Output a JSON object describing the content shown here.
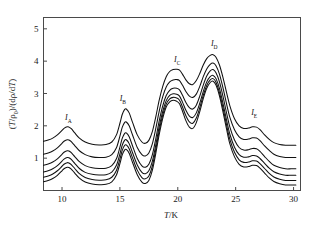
{
  "chart_data": {
    "type": "line",
    "title": "",
    "xlabel": "T/K",
    "ylabel": "(T/ρ0)/(dρ/dT)",
    "xlabel_parts": {
      "italic": "T",
      "rest": "/K"
    },
    "ylabel_parts": {
      "p1_italic": "T",
      "p2": "/ρ",
      "p2_sub": "0",
      "p3": ")/(dρ/d",
      "p4_italic": "T",
      "p5": ")",
      "open": "("
    },
    "xlim": [
      8.4,
      30.6
    ],
    "ylim": [
      0.0,
      5.35
    ],
    "xticks": [
      10,
      15,
      20,
      25,
      30
    ],
    "xticklabels": [
      "10",
      "15",
      "20",
      "25",
      "30"
    ],
    "yticks": [
      1,
      2,
      3,
      4,
      5
    ],
    "yticklabels": [
      "1",
      "2",
      "3",
      "4",
      "5"
    ],
    "grid": false,
    "legend": false,
    "frame": "box",
    "annotations": [
      {
        "name": "I_A",
        "letter": "I",
        "sub": "A",
        "x": 10.55,
        "y": 2.17
      },
      {
        "name": "I_B",
        "letter": "I",
        "sub": "B",
        "x": 15.25,
        "y": 2.78
      },
      {
        "name": "I_C",
        "letter": "I",
        "sub": "C",
        "x": 19.95,
        "y": 3.98
      },
      {
        "name": "I_D",
        "letter": "I",
        "sub": "D",
        "x": 23.15,
        "y": 4.46
      },
      {
        "name": "I_E",
        "letter": "I",
        "sub": "E",
        "x": 26.6,
        "y": 2.32
      }
    ],
    "series_note": "six resistivity-derivative curves, vertically offset",
    "x": [
      8.4,
      8.8,
      9.2,
      9.6,
      10.0,
      10.2,
      10.45,
      10.6,
      10.8,
      11.1,
      11.5,
      12.0,
      12.6,
      13.2,
      13.8,
      14.3,
      14.7,
      15.0,
      15.2,
      15.4,
      15.55,
      15.8,
      16.1,
      16.5,
      16.9,
      17.2,
      17.5,
      17.8,
      18.1,
      18.4,
      18.7,
      19.0,
      19.3,
      19.6,
      19.9,
      20.15,
      20.4,
      20.7,
      21.0,
      21.3,
      21.6,
      21.9,
      22.2,
      22.5,
      22.8,
      23.05,
      23.3,
      23.6,
      23.9,
      24.2,
      24.5,
      24.9,
      25.3,
      25.7,
      26.1,
      26.45,
      26.8,
      27.1,
      27.5,
      27.9,
      28.3,
      28.8,
      29.3,
      29.8,
      30.2
    ],
    "series": [
      {
        "name": "curve-1",
        "baseline": 1.4,
        "values": [
          1.52,
          1.56,
          1.62,
          1.72,
          1.86,
          1.93,
          1.97,
          1.96,
          1.91,
          1.78,
          1.62,
          1.5,
          1.43,
          1.41,
          1.42,
          1.5,
          1.72,
          2.08,
          2.35,
          2.5,
          2.52,
          2.4,
          2.1,
          1.72,
          1.5,
          1.46,
          1.55,
          1.82,
          2.28,
          2.8,
          3.22,
          3.52,
          3.68,
          3.74,
          3.75,
          3.72,
          3.6,
          3.42,
          3.3,
          3.28,
          3.4,
          3.62,
          3.88,
          4.08,
          4.18,
          4.2,
          4.12,
          3.88,
          3.5,
          3.05,
          2.62,
          2.22,
          2.0,
          1.92,
          1.93,
          1.97,
          1.96,
          1.88,
          1.72,
          1.58,
          1.48,
          1.42,
          1.4,
          1.4,
          1.4
        ]
      },
      {
        "name": "curve-2",
        "baseline": 1.02,
        "values": [
          1.12,
          1.16,
          1.22,
          1.32,
          1.46,
          1.53,
          1.57,
          1.56,
          1.51,
          1.39,
          1.23,
          1.11,
          1.04,
          1.02,
          1.03,
          1.11,
          1.32,
          1.68,
          1.95,
          2.1,
          2.12,
          2.0,
          1.71,
          1.33,
          1.11,
          1.07,
          1.16,
          1.44,
          1.92,
          2.46,
          2.9,
          3.2,
          3.36,
          3.42,
          3.43,
          3.4,
          3.26,
          3.06,
          2.92,
          2.88,
          2.98,
          3.22,
          3.52,
          3.76,
          3.9,
          3.94,
          3.86,
          3.6,
          3.18,
          2.7,
          2.26,
          1.88,
          1.66,
          1.58,
          1.59,
          1.63,
          1.62,
          1.54,
          1.38,
          1.24,
          1.12,
          1.05,
          1.02,
          1.02,
          1.02
        ]
      },
      {
        "name": "curve-3",
        "baseline": 0.67,
        "values": [
          0.78,
          0.82,
          0.88,
          0.98,
          1.12,
          1.19,
          1.23,
          1.22,
          1.17,
          1.05,
          0.89,
          0.77,
          0.7,
          0.68,
          0.69,
          0.77,
          0.98,
          1.34,
          1.61,
          1.76,
          1.78,
          1.66,
          1.37,
          0.99,
          0.76,
          0.72,
          0.81,
          1.1,
          1.6,
          2.16,
          2.62,
          2.94,
          3.1,
          3.16,
          3.16,
          3.11,
          2.95,
          2.72,
          2.56,
          2.52,
          2.64,
          2.92,
          3.26,
          3.54,
          3.7,
          3.74,
          3.64,
          3.36,
          2.92,
          2.42,
          1.96,
          1.56,
          1.33,
          1.25,
          1.26,
          1.3,
          1.29,
          1.21,
          1.05,
          0.9,
          0.78,
          0.71,
          0.67,
          0.67,
          0.67
        ]
      },
      {
        "name": "curve-4",
        "baseline": 0.47,
        "values": [
          0.57,
          0.61,
          0.67,
          0.77,
          0.91,
          0.98,
          1.02,
          1.01,
          0.96,
          0.84,
          0.68,
          0.56,
          0.5,
          0.48,
          0.49,
          0.57,
          0.78,
          1.13,
          1.4,
          1.55,
          1.57,
          1.45,
          1.16,
          0.79,
          0.56,
          0.52,
          0.61,
          0.9,
          1.41,
          1.98,
          2.45,
          2.78,
          2.94,
          2.99,
          2.98,
          2.92,
          2.74,
          2.48,
          2.3,
          2.26,
          2.4,
          2.7,
          3.06,
          3.36,
          3.52,
          3.56,
          3.46,
          3.16,
          2.7,
          2.2,
          1.74,
          1.34,
          1.11,
          1.03,
          1.04,
          1.08,
          1.07,
          0.99,
          0.84,
          0.69,
          0.58,
          0.51,
          0.47,
          0.47,
          0.47
        ]
      },
      {
        "name": "curve-5",
        "baseline": 0.31,
        "values": [
          0.41,
          0.45,
          0.51,
          0.61,
          0.75,
          0.82,
          0.86,
          0.85,
          0.8,
          0.68,
          0.52,
          0.4,
          0.34,
          0.32,
          0.33,
          0.41,
          0.62,
          0.97,
          1.24,
          1.39,
          1.41,
          1.29,
          1.0,
          0.63,
          0.4,
          0.36,
          0.45,
          0.75,
          1.27,
          1.85,
          2.33,
          2.67,
          2.83,
          2.88,
          2.86,
          2.79,
          2.59,
          2.31,
          2.12,
          2.08,
          2.24,
          2.56,
          2.94,
          3.25,
          3.42,
          3.46,
          3.35,
          3.03,
          2.56,
          2.05,
          1.58,
          1.18,
          0.95,
          0.87,
          0.88,
          0.92,
          0.91,
          0.83,
          0.68,
          0.53,
          0.42,
          0.35,
          0.31,
          0.31,
          0.31
        ]
      },
      {
        "name": "curve-6",
        "baseline": 0.17,
        "values": [
          0.27,
          0.31,
          0.37,
          0.47,
          0.61,
          0.68,
          0.72,
          0.71,
          0.66,
          0.54,
          0.38,
          0.26,
          0.2,
          0.18,
          0.19,
          0.27,
          0.48,
          0.83,
          1.1,
          1.25,
          1.27,
          1.15,
          0.86,
          0.49,
          0.26,
          0.22,
          0.31,
          0.62,
          1.15,
          1.74,
          2.23,
          2.58,
          2.74,
          2.79,
          2.76,
          2.68,
          2.46,
          2.16,
          1.96,
          1.92,
          2.1,
          2.44,
          2.84,
          3.16,
          3.34,
          3.38,
          3.26,
          2.93,
          2.44,
          1.92,
          1.44,
          1.04,
          0.81,
          0.73,
          0.74,
          0.78,
          0.77,
          0.69,
          0.54,
          0.39,
          0.28,
          0.21,
          0.17,
          0.17,
          0.17
        ]
      }
    ]
  }
}
